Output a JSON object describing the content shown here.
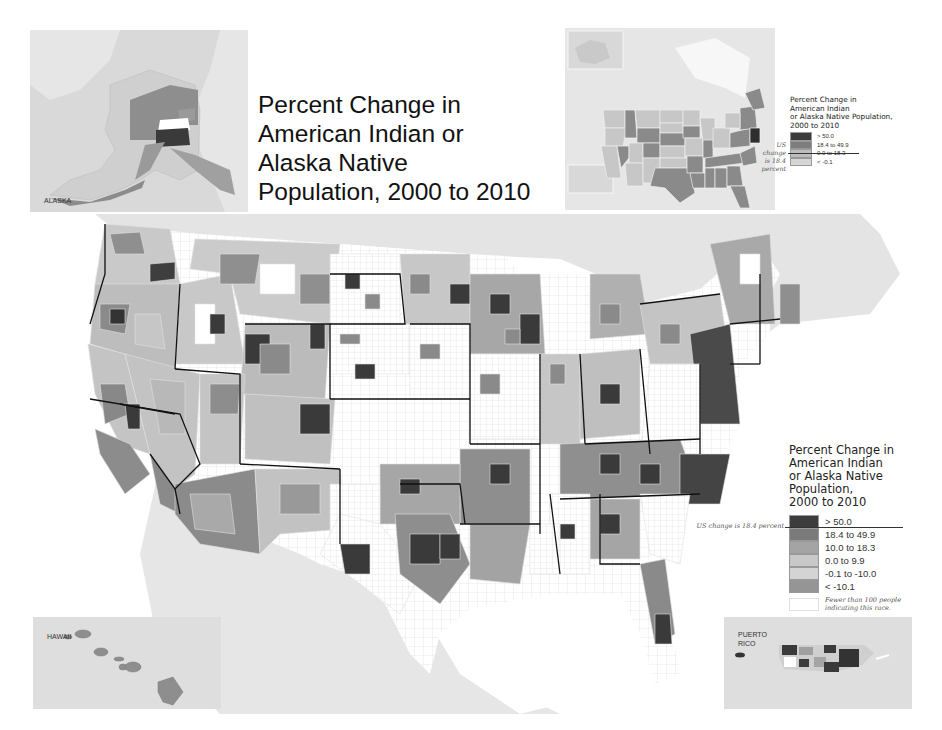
{
  "title": {
    "lines": [
      "Percent Change in",
      "American Indian or",
      "Alaska Native",
      "Population, 2000 to 2010"
    ]
  },
  "insets": {
    "alaska": {
      "label": "ALASKA"
    },
    "hawaii": {
      "label": "HAWAII"
    },
    "puerto_rico": {
      "label_line1": "PUERTO",
      "label_line2": "RICO"
    }
  },
  "state_legend": {
    "title_lines": [
      "Percent Change in",
      "American Indian",
      "or Alaska Native Population,",
      "2000 to 2010"
    ],
    "us_change_lines": [
      "US",
      "change",
      "is 18.4 percent"
    ],
    "classes": [
      {
        "label": "> 50.0",
        "color": "#3c3c3c"
      },
      {
        "label": "18.4 to 49.9",
        "color": "#7d7d7d"
      },
      {
        "label": "0.0 to 18.3",
        "color": "#bdbdbd"
      },
      {
        "label": "< -0.1",
        "color": "#d6d6d6"
      }
    ]
  },
  "county_legend": {
    "title_lines": [
      "Percent Change in",
      "American Indian",
      "or Alaska Native Population,",
      "2000 to 2010"
    ],
    "us_change": "US change is 18.4 percent",
    "classes": [
      {
        "label": "> 50.0",
        "color": "#3c3c3c"
      },
      {
        "label": "18.4 to 49.9",
        "color": "#7a7a7a"
      },
      {
        "label": "10.0 to 18.3",
        "color": "#a4a4a4"
      },
      {
        "label": "0.0 to 9.9",
        "color": "#c8c8c8"
      },
      {
        "label": "-0.1 to -10.0",
        "color": "#d4d4d4"
      },
      {
        "label": "< -10.1",
        "color": "#959595"
      }
    ],
    "no_data": {
      "label_line1": "Fewer than 100 people",
      "label_line2": "indicating this race.",
      "color": "#ffffff"
    }
  },
  "colors": {
    "background": "#ffffff",
    "water_land_outside": "#e3e3e3",
    "state_border": "#111111",
    "county_border": "#cccccc"
  }
}
